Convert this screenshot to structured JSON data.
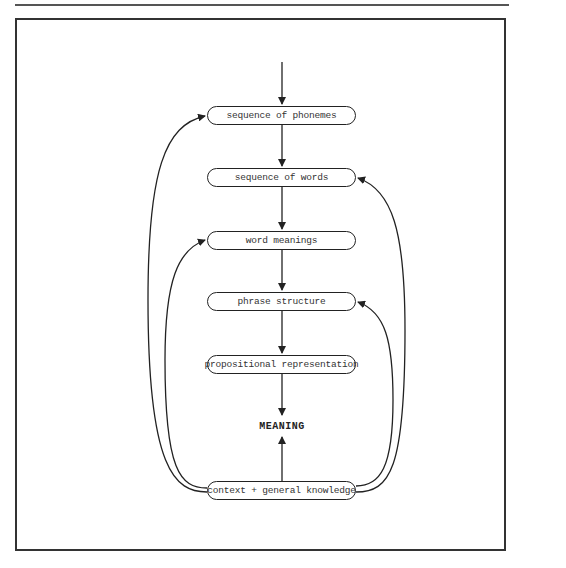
{
  "diagram": {
    "nodes": [
      {
        "id": "phonemes",
        "label": "sequence of phonemes"
      },
      {
        "id": "words",
        "label": "sequence of words"
      },
      {
        "id": "meanings",
        "label": "word meanings"
      },
      {
        "id": "phrase",
        "label": "phrase structure"
      },
      {
        "id": "propositional",
        "label": "propositional representation"
      },
      {
        "id": "context",
        "label": "context + general knowledge"
      }
    ],
    "output": "MEANING",
    "edges": [
      {
        "from": "input",
        "to": "phonemes"
      },
      {
        "from": "phonemes",
        "to": "words"
      },
      {
        "from": "words",
        "to": "meanings"
      },
      {
        "from": "meanings",
        "to": "phrase"
      },
      {
        "from": "phrase",
        "to": "propositional"
      },
      {
        "from": "propositional",
        "to": "MEANING"
      },
      {
        "from": "context",
        "to": "MEANING"
      },
      {
        "from": "context",
        "to": "phonemes",
        "side": "left"
      },
      {
        "from": "context",
        "to": "meanings",
        "side": "left"
      },
      {
        "from": "context",
        "to": "words",
        "side": "right"
      },
      {
        "from": "context",
        "to": "phrase",
        "side": "right"
      }
    ],
    "colors": {
      "stroke": "#222222",
      "background": "#ffffff"
    }
  }
}
